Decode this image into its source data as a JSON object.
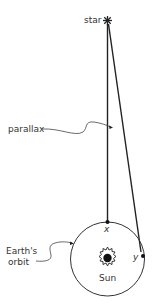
{
  "diagram": {
    "type": "astronomy-parallax",
    "labels": {
      "star": "star",
      "parallax": "parallax",
      "orbit_line1": "Earth's",
      "orbit_line2": "orbit",
      "sun": "Sun",
      "point_x": "x",
      "point_y": "y"
    },
    "colors": {
      "line": "#222222",
      "text": "#333333",
      "background": "#ffffff"
    }
  }
}
